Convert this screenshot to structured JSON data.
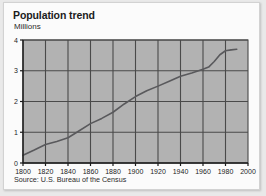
{
  "card": {
    "title": "Population trend",
    "source": "Source: U.S. Bureau of the Census"
  },
  "chart_data": {
    "type": "line",
    "title": "Population trend",
    "subtitle": "",
    "xlabel": "",
    "ylabel": "Millions",
    "xlim": [
      1800,
      2000
    ],
    "ylim": [
      0,
      4
    ],
    "grid": true,
    "legend": "none",
    "xticks": [
      1800,
      1820,
      1840,
      1860,
      1880,
      1900,
      1920,
      1940,
      1960,
      1980,
      2000
    ],
    "yticks": [
      0,
      1,
      2,
      3,
      4
    ],
    "series": [
      {
        "name": "Population",
        "color": "#59595c",
        "x": [
          1800,
          1810,
          1820,
          1830,
          1840,
          1850,
          1860,
          1870,
          1880,
          1890,
          1900,
          1910,
          1920,
          1930,
          1940,
          1950,
          1960,
          1965,
          1970,
          1975,
          1980,
          1985,
          1990
        ],
        "values": [
          0.25,
          0.42,
          0.6,
          0.7,
          0.82,
          1.05,
          1.28,
          1.45,
          1.65,
          1.92,
          2.16,
          2.35,
          2.5,
          2.66,
          2.82,
          2.93,
          3.05,
          3.12,
          3.3,
          3.52,
          3.65,
          3.68,
          3.7
        ]
      }
    ],
    "annotations": [
      {
        "text": "Source: U.S. Bureau of the Census",
        "position": "below-axis-left"
      }
    ],
    "colors": {
      "plot_background": "#b2b2b2",
      "gridlines": "#4a4a4a",
      "axis": "#1c1c1c",
      "line": "#59595c",
      "card_background": "#fbfbfb",
      "page_background": "#e9e9e9"
    }
  }
}
